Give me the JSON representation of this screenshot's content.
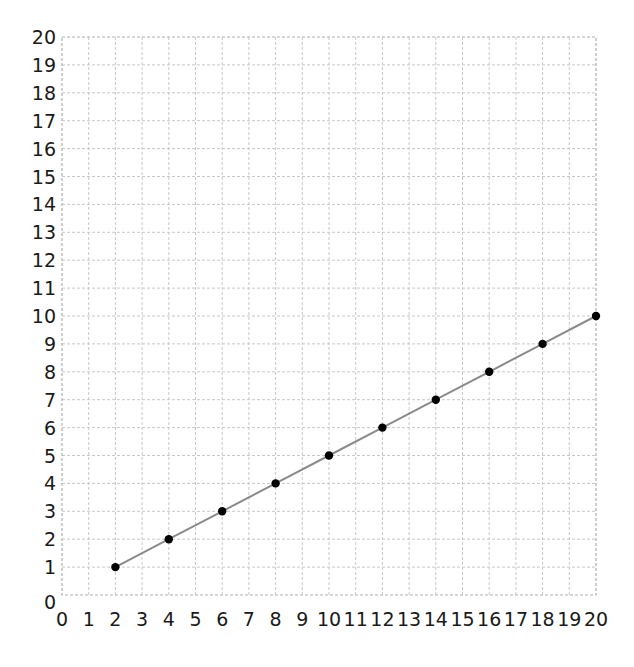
{
  "chart_data": {
    "type": "line",
    "title": "",
    "xlabel": "",
    "ylabel": "",
    "xlim": [
      0,
      20
    ],
    "ylim": [
      0,
      20
    ],
    "grid": true,
    "legend": null,
    "x_ticks": [
      0,
      1,
      2,
      3,
      4,
      5,
      6,
      7,
      8,
      9,
      10,
      11,
      12,
      13,
      14,
      15,
      16,
      17,
      18,
      19,
      20
    ],
    "y_ticks": [
      0,
      1,
      2,
      3,
      4,
      5,
      6,
      7,
      8,
      9,
      10,
      11,
      12,
      13,
      14,
      15,
      16,
      17,
      18,
      19,
      20
    ],
    "series": [
      {
        "name": "y = x / 2",
        "x": [
          2,
          4,
          6,
          8,
          10,
          12,
          14,
          16,
          18,
          20
        ],
        "values": [
          1,
          2,
          3,
          4,
          5,
          6,
          7,
          8,
          9,
          10
        ],
        "line_color": "#8a8a8a",
        "marker_color": "#000000"
      }
    ]
  },
  "colors": {
    "grid": "#c8c8c8",
    "frame": "#b0b0b0",
    "text": "#1a1a1a",
    "background": "#ffffff"
  }
}
